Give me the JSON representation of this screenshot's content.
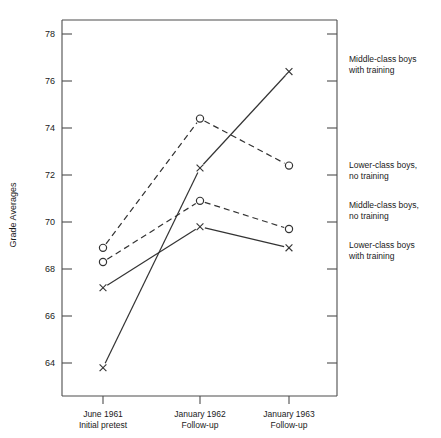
{
  "chart_data": {
    "type": "line",
    "title": "",
    "xlabel": "",
    "ylabel": "Grade Averages",
    "categories": [
      "June 1961\nInitial pretest",
      "January 1962\nFollow-up",
      "January 1963\nFollow-up"
    ],
    "x_tick_labels": [
      {
        "line1": "June 1961",
        "line2": "Initial pretest"
      },
      {
        "line1": "January 1962",
        "line2": "Follow-up"
      },
      {
        "line1": "January 1963",
        "line2": "Follow-up"
      }
    ],
    "ylim": [
      63.0,
      79.0
    ],
    "y_ticks": [
      64,
      66,
      68,
      70,
      72,
      74,
      76,
      78
    ],
    "y_tick_labels": [
      "64",
      "66",
      "68",
      "70",
      "72",
      "74",
      "76",
      "78"
    ],
    "grid": false,
    "legend_position": "right-inline",
    "series": [
      {
        "name": "Middle-class boys with training",
        "label_line1": "Middle-class boys",
        "label_line2": "with training",
        "marker": "x",
        "line_style": "solid",
        "values": [
          63.8,
          72.3,
          76.4
        ],
        "label_y_value": 76.4
      },
      {
        "name": "Lower-class boys, no training",
        "label_line1": "Lower-class boys,",
        "label_line2": "no training",
        "marker": "circle",
        "line_style": "dashed",
        "values": [
          68.9,
          74.4,
          72.4
        ],
        "label_y_value": 72.4
      },
      {
        "name": "Middle-class boys, no training",
        "label_line1": "Middle-class boys,",
        "label_line2": "no training",
        "marker": "circle",
        "line_style": "dashed",
        "values": [
          68.3,
          70.9,
          69.7
        ],
        "label_y_value": 69.7
      },
      {
        "name": "Lower-class boys with training",
        "label_line1": "Lower-class boys",
        "label_line2": "with training",
        "marker": "x",
        "line_style": "solid",
        "values": [
          67.2,
          69.8,
          68.9
        ],
        "label_y_value": 68.9
      }
    ]
  },
  "axis": {
    "y_title": "Grade Averages"
  },
  "ticks": {
    "y": {
      "t78": "78",
      "t76": "76",
      "t74": "74",
      "t72": "72",
      "t70": "70",
      "t68": "68",
      "t66": "66",
      "t64": "64"
    },
    "x": {
      "c0l1": "June 1961",
      "c0l2": "Initial pretest",
      "c1l1": "January 1962",
      "c1l2": "Follow-up",
      "c2l1": "January 1963",
      "c2l2": "Follow-up"
    }
  },
  "legend": {
    "s0l1": "Middle-class boys",
    "s0l2": "with training",
    "s1l1": "Lower-class boys,",
    "s1l2": "no training",
    "s2l1": "Middle-class boys,",
    "s2l2": "no training",
    "s3l1": "Lower-class boys",
    "s3l2": "with training"
  },
  "colors": {
    "ink": "#333333",
    "axis": "#4d4d4d",
    "background": "#ffffff"
  }
}
